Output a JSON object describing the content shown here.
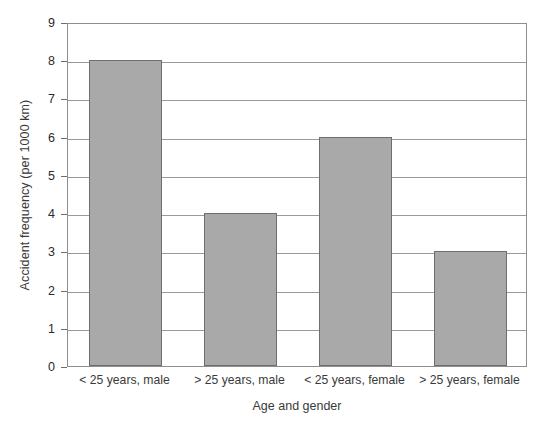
{
  "chart_data": {
    "type": "bar",
    "title": "",
    "xlabel": "Age and gender",
    "ylabel": "Accident frequency (per 1000 km)",
    "categories": [
      "< 25 years, male",
      "> 25 years, male",
      "< 25 years, female",
      "> 25 years, female"
    ],
    "values": [
      8,
      4,
      6,
      3
    ],
    "ylim": [
      0,
      9
    ],
    "ytick_labels": [
      "0",
      "1",
      "2",
      "3",
      "4",
      "5",
      "6",
      "7",
      "8",
      "9"
    ],
    "yticks": [
      0,
      1,
      2,
      3,
      4,
      5,
      6,
      7,
      8,
      9
    ],
    "grid": true,
    "legend": "none",
    "bar_color": "#a9a9a9",
    "bar_edge_color": "#6e6e6e",
    "grid_color": "#9a9a9a",
    "axis_color": "#8e8e8e",
    "background_color": "#ffffff"
  }
}
